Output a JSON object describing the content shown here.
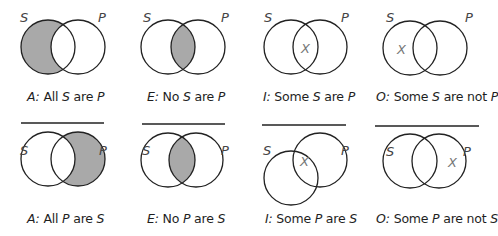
{
  "colors": {
    "shade": "#a9a9a9",
    "stroke": "#222222",
    "x_mark": "#777777",
    "label": "#444444"
  },
  "set_labels": {
    "s": "S",
    "p": "P"
  },
  "x_mark": "X",
  "top_row": [
    {
      "type": "A",
      "prefix": "A:",
      "parts": [
        "All",
        "S",
        "are",
        "P"
      ],
      "shaded": "S-only",
      "x": null
    },
    {
      "type": "E",
      "prefix": "E:",
      "parts": [
        "No",
        "S",
        "are",
        "P"
      ],
      "shaded": "intersection",
      "x": null
    },
    {
      "type": "I",
      "prefix": "I:",
      "parts": [
        "Some",
        "S",
        "are",
        "P"
      ],
      "shaded": null,
      "x": "intersection"
    },
    {
      "type": "O",
      "prefix": "O:",
      "parts": [
        "Some",
        "S",
        "are not",
        "P"
      ],
      "shaded": null,
      "x": "S-only"
    }
  ],
  "bottom_row": [
    {
      "type": "A",
      "prefix": "A:",
      "parts": [
        "All",
        "P",
        "are",
        "S"
      ],
      "shaded": "P-only",
      "x": null
    },
    {
      "type": "E",
      "prefix": "E:",
      "parts": [
        "No",
        "P",
        "are",
        "S"
      ],
      "shaded": "intersection",
      "x": null
    },
    {
      "type": "I",
      "prefix": "I:",
      "parts": [
        "Some",
        "P",
        "are",
        "S"
      ],
      "shaded": null,
      "x": "intersection"
    },
    {
      "type": "O",
      "prefix": "O:",
      "parts": [
        "Some",
        "P",
        "are not",
        "S"
      ],
      "shaded": null,
      "x": "P-only"
    }
  ]
}
